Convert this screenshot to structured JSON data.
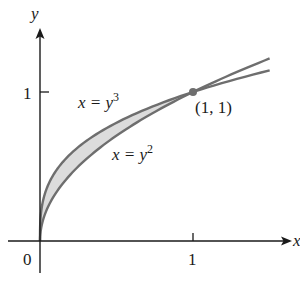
{
  "figure": {
    "axes": {
      "x_label": "x",
      "y_label": "y",
      "origin_label": "0",
      "x_tick_label": "1",
      "y_tick_label": "1"
    },
    "curves": [
      {
        "name": "cube",
        "label_lhs": "x = y",
        "label_exp": "3",
        "equation": "x = y^3"
      },
      {
        "name": "square",
        "label_lhs": "x = y",
        "label_exp": "2",
        "equation": "x = y^2"
      }
    ],
    "intersection_point": {
      "label": "(1, 1)",
      "x": 1,
      "y": 1
    },
    "shaded_region": "region between x = y^3 and x = y^2 for 0 ≤ y ≤ 1",
    "colors": {
      "curve": "#6e6e6e",
      "shade": "#dcdcdc",
      "axis": "#1a1a1a",
      "point": "#6e6e6e"
    }
  }
}
